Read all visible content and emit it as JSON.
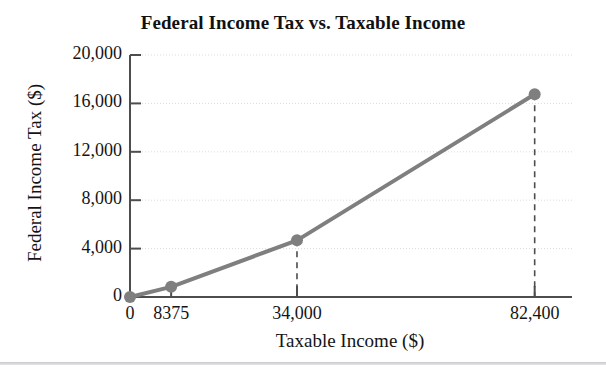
{
  "chart_data": {
    "type": "line",
    "title": "Federal Income Tax vs. Taxable Income",
    "xlabel": "Taxable Income ($)",
    "ylabel": "Federal Income Tax ($)",
    "x": [
      0,
      8375,
      34000,
      82400
    ],
    "values": [
      0,
      838,
      4681,
      16750
    ],
    "point_labels": [
      "0",
      "8375",
      "34,000",
      "82,400"
    ],
    "xlim": [
      0,
      90000
    ],
    "ylim": [
      0,
      20000
    ],
    "xticks": [
      0,
      8375,
      34000,
      82400
    ],
    "xtick_labels": [
      "0",
      "8375",
      "34,000",
      "82,400"
    ],
    "yticks": [
      0,
      4000,
      8000,
      12000,
      16000,
      20000
    ],
    "ytick_labels": [
      "0",
      "4,000",
      "8,000",
      "12,000",
      "16,000",
      "20,000"
    ],
    "grid": true,
    "grid_style": "dotted-horizontal",
    "legend": null,
    "annotations": [
      {
        "type": "dashed-drop-line",
        "x": 34000,
        "y": 4681
      },
      {
        "type": "dashed-drop-line",
        "x": 82400,
        "y": 16750
      }
    ],
    "series_color": "#807f80",
    "marker_color": "#807f80",
    "marker": "circle",
    "markers_at": [
      0,
      8375,
      34000,
      82400
    ]
  },
  "colors": {
    "series": "#807f80",
    "marker": "#807f80",
    "axis": "#4d4d4d",
    "grid": "#dcdcdc",
    "text": "#141414",
    "background": "#ffffff",
    "bottom_rule": "#c9c9cc"
  }
}
